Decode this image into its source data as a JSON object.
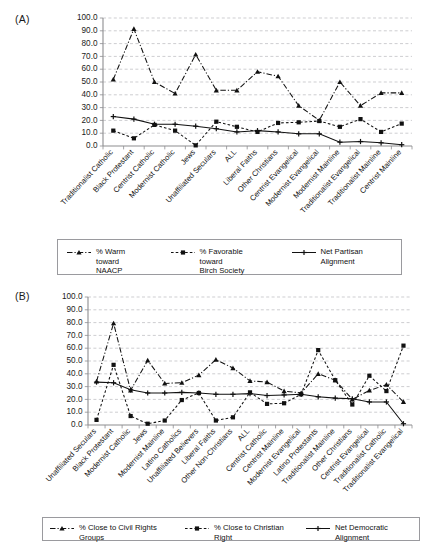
{
  "figure": {
    "panel_a_letter": "(A)",
    "panel_b_letter": "(B)"
  },
  "chart_data": [
    {
      "id": "panel-a",
      "type": "line",
      "title": "",
      "panel_label": "(A)",
      "xlabel": "",
      "ylabel": "",
      "ylim": [
        0,
        100
      ],
      "ytick_labels": [
        "0.0",
        "10.0",
        "20.0",
        "30.0",
        "40.0",
        "50.0",
        "60.0",
        "70.0",
        "80.0",
        "90.0",
        "100.0"
      ],
      "yticks": [
        0,
        10,
        20,
        30,
        40,
        50,
        60,
        70,
        80,
        90,
        100
      ],
      "grid": true,
      "legend_position": "bottom",
      "categories": [
        "Traditionalist Catholic",
        "Black Protestant",
        "Centrist Catholic",
        "Modernist Catholic",
        "Jews",
        "Unaffiliated Seculars",
        "ALL",
        "Liberal Faiths",
        "Other Christians",
        "Centrist Evangelical",
        "Modernist Evangelical",
        "Modernist Mainline",
        "Traditionalist Evangelical",
        "Traditionalist Mainline",
        "Centrist Mainline"
      ],
      "series": [
        {
          "name": "% Warm toward NAACP",
          "style": "dash-dot",
          "marker": "triangle",
          "values": [
            52.0,
            91.5,
            50.0,
            41.0,
            71.5,
            43.5,
            43.5,
            58.0,
            54.5,
            31.5,
            20.0,
            50.0,
            31.5,
            41.5,
            41.5
          ]
        },
        {
          "name": "% Favorable toward Birch Society",
          "style": "dashed",
          "marker": "square",
          "values": [
            12.0,
            6.0,
            16.5,
            12.0,
            0.5,
            19.0,
            15.0,
            11.0,
            18.0,
            18.5,
            19.5,
            15.0,
            21.0,
            11.0,
            17.5
          ]
        },
        {
          "name": "Net Partisan Alignment",
          "style": "solid",
          "marker": "plus",
          "values": [
            23.0,
            21.0,
            17.0,
            17.0,
            15.5,
            13.5,
            11.0,
            12.0,
            11.0,
            9.5,
            9.5,
            3.0,
            3.5,
            2.5,
            1.0
          ]
        }
      ],
      "legend": [
        {
          "label": "% Warm toward\nNAACP",
          "style": "dash-dot",
          "marker": "triangle"
        },
        {
          "label": "% Favorable toward\nBirch Society",
          "style": "dashed",
          "marker": "square"
        },
        {
          "label": "Net Partisan Alignment",
          "style": "solid",
          "marker": "plus"
        }
      ]
    },
    {
      "id": "panel-b",
      "type": "line",
      "title": "",
      "panel_label": "(B)",
      "xlabel": "",
      "ylabel": "",
      "ylim": [
        0,
        100
      ],
      "ytick_labels": [
        "0.0",
        "10.0",
        "20.0",
        "30.0",
        "40.0",
        "50.0",
        "60.0",
        "70.0",
        "80.0",
        "90.0",
        "100.0"
      ],
      "yticks": [
        0,
        10,
        20,
        30,
        40,
        50,
        60,
        70,
        80,
        90,
        100
      ],
      "grid": true,
      "legend_position": "bottom",
      "categories": [
        "Unaffiliated Seculars",
        "Black Protestant",
        "Modernist Catholic",
        "Jews",
        "Modernist Mainline",
        "Latino Catholics",
        "Unaffiliated Believers",
        "Liberal Faiths",
        "Other Non-Christians",
        "ALL",
        "Centrist Catholic",
        "Centrist Mainline",
        "Modernist Evangelical",
        "Latino Protestants",
        "Traditionalist Mainline",
        "Other Christians",
        "Centrist Evangelical",
        "Traditionalist Catholic",
        "Traditionalist Evangelical"
      ],
      "series": [
        {
          "name": "% Close to Civil Rights Groups",
          "style": "dash-dot",
          "marker": "triangle",
          "values": [
            34.0,
            79.5,
            27.0,
            50.5,
            32.5,
            33.0,
            39.0,
            51.0,
            44.5,
            34.5,
            33.5,
            26.5,
            25.0,
            40.0,
            35.0,
            20.0,
            27.0,
            31.5,
            18.0
          ]
        },
        {
          "name": "% Close to Christian Right",
          "style": "dashed",
          "marker": "square",
          "values": [
            4.0,
            47.0,
            7.0,
            1.0,
            3.5,
            19.5,
            25.0,
            3.5,
            6.0,
            25.5,
            16.5,
            17.0,
            24.0,
            58.5,
            35.0,
            16.0,
            38.5,
            26.5,
            62.0
          ]
        },
        {
          "name": "Net Democratic Alignment",
          "style": "solid",
          "marker": "plus",
          "values": [
            33.5,
            33.0,
            27.5,
            25.0,
            25.0,
            25.5,
            25.0,
            24.0,
            24.0,
            24.5,
            23.0,
            23.5,
            24.0,
            22.0,
            21.0,
            20.5,
            18.0,
            18.0,
            1.0
          ]
        }
      ],
      "legend": [
        {
          "label": "% Close to Civil Rights Groups",
          "style": "dash-dot",
          "marker": "triangle"
        },
        {
          "label": "% Close to Christian Right",
          "style": "dashed",
          "marker": "square"
        },
        {
          "label": "Net Democratic Alignment",
          "style": "solid",
          "marker": "plus"
        }
      ]
    }
  ]
}
